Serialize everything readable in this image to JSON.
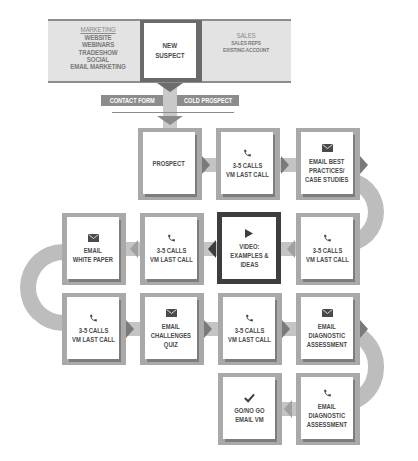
{
  "header": {
    "marketing": {
      "title": "MARKETING",
      "items": [
        "WEBSITE",
        "WEBINARS",
        "TRADESHOW",
        "SOCIAL",
        "EMAIL MARKETING"
      ]
    },
    "center": {
      "line1": "NEW",
      "line2": "SUSPECT"
    },
    "sales": {
      "title": "SALES",
      "items": [
        "SALES REPS",
        "EXISTING ACCOUNT"
      ]
    }
  },
  "sources": {
    "left": "CONTACT FORM",
    "right": "COLD PROSPECT"
  },
  "rows": [
    {
      "direction": "right",
      "steps": [
        {
          "icon": "none",
          "lines": [
            "PROSPECT"
          ]
        },
        {
          "icon": "phone-icon",
          "lines": [
            "3-5 CALLS",
            "VM LAST CALL"
          ]
        },
        {
          "icon": "envelope-icon",
          "lines": [
            "EMAIL BEST",
            "PRACTICES/",
            "CASE STUDIES"
          ]
        }
      ]
    },
    {
      "direction": "left",
      "steps": [
        {
          "icon": "envelope-icon",
          "lines": [
            "EMAIL",
            "WHITE PAPER"
          ]
        },
        {
          "icon": "phone-icon",
          "lines": [
            "3-5 CALLS",
            "VM LAST CALL"
          ]
        },
        {
          "icon": "play-icon",
          "lines": [
            "VIDEO:",
            "EXAMPLES &",
            "IDEAS"
          ],
          "highlight": true
        },
        {
          "icon": "phone-icon",
          "lines": [
            "3-5 CALLS",
            "VM LAST CALL"
          ]
        }
      ]
    },
    {
      "direction": "right",
      "steps": [
        {
          "icon": "phone-icon",
          "lines": [
            "3-5 CALLS",
            "VM LAST CALL"
          ]
        },
        {
          "icon": "envelope-icon",
          "lines": [
            "EMAIL",
            "CHALLENGES",
            "QUIZ"
          ]
        },
        {
          "icon": "phone-icon",
          "lines": [
            "3-5 CALLS",
            "VM LAST CALL"
          ]
        },
        {
          "icon": "envelope-icon",
          "lines": [
            "EMAIL",
            "DIAGNOSTIC",
            "ASSESSMENT"
          ]
        }
      ]
    },
    {
      "direction": "left",
      "steps": [
        {
          "icon": "checkmark-icon",
          "lines": [
            "GO/NO GO",
            "EMAIL VM"
          ]
        },
        {
          "icon": "phone-icon",
          "lines": [
            "EMAIL",
            "DIAGNOSTIC",
            "ASSESSMENT"
          ]
        }
      ]
    }
  ],
  "colors": {
    "band": "#e3e3e3",
    "box_frame": "#a9a9a9",
    "highlight_frame": "#3e3e3e",
    "connector": "#c4c4c4",
    "arrow": "#7a7a7a",
    "text": "#4a4a4a"
  }
}
